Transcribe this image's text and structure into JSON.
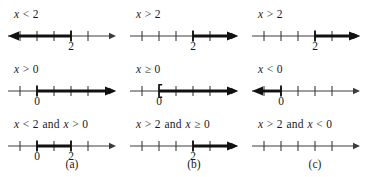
{
  "figure": {
    "background": "#ffffff",
    "ink": "#1a1a1a",
    "thin_color": "#3c3c3c",
    "thick_color": "#111111",
    "panels": [
      {
        "letter": "(a)",
        "x": 72
      },
      {
        "letter": "(b)",
        "x": 194
      },
      {
        "letter": "(c)",
        "x": 315
      }
    ],
    "cells": [
      {
        "id": "r1c1",
        "row": 0,
        "col": 0,
        "label": {
          "lhs_var": "x",
          "op": "<",
          "rhs": "2"
        },
        "label_text": "x < 2",
        "axis": {
          "ticks": [
            20,
            37,
            54,
            71,
            88
          ],
          "tick_numbers": [
            {
              "value": "2",
              "x": 71
            }
          ],
          "line_start": 8,
          "line_end": 116
        },
        "highlight": {
          "type": "ray-left",
          "from": 71,
          "to": 10,
          "endpoint": "open",
          "arrow": "left"
        }
      },
      {
        "id": "r1c2",
        "row": 0,
        "col": 1,
        "label": {
          "lhs_var": "x",
          "op": ">",
          "rhs": "2"
        },
        "label_text": "x > 2",
        "axis": {
          "ticks": [
            20,
            37,
            54,
            71,
            88
          ],
          "tick_numbers": [
            {
              "value": "2",
              "x": 71
            }
          ],
          "line_start": 8,
          "line_end": 116
        },
        "highlight": {
          "type": "ray-right",
          "from": 71,
          "to": 114,
          "endpoint": "open",
          "arrow": "right"
        }
      },
      {
        "id": "r1c3",
        "row": 0,
        "col": 2,
        "label": {
          "lhs_var": "x",
          "op": ">",
          "rhs": "2"
        },
        "label_text": "x > 2",
        "axis": {
          "ticks": [
            20,
            37,
            54,
            71,
            88
          ],
          "tick_numbers": [
            {
              "value": "2",
              "x": 71
            }
          ],
          "line_start": 8,
          "line_end": 116
        },
        "highlight": {
          "type": "ray-right",
          "from": 71,
          "to": 114,
          "endpoint": "open",
          "arrow": "right"
        }
      },
      {
        "id": "r2c1",
        "row": 1,
        "col": 0,
        "label": {
          "lhs_var": "x",
          "op": ">",
          "rhs": "0"
        },
        "label_text": "x > 0",
        "axis": {
          "ticks": [
            20,
            37,
            54,
            71,
            88
          ],
          "tick_numbers": [
            {
              "value": "0",
              "x": 37
            }
          ],
          "line_start": 8,
          "line_end": 116
        },
        "highlight": {
          "type": "ray-right",
          "from": 37,
          "to": 114,
          "endpoint": "open",
          "arrow": "right"
        }
      },
      {
        "id": "r2c2",
        "row": 1,
        "col": 1,
        "label": {
          "lhs_var": "x",
          "op": "≥",
          "rhs": "0"
        },
        "label_text": "x ≥ 0",
        "axis": {
          "ticks": [
            20,
            37,
            54,
            71,
            88
          ],
          "tick_numbers": [
            {
              "value": "0",
              "x": 37
            }
          ],
          "line_start": 8,
          "line_end": 116
        },
        "highlight": {
          "type": "ray-right",
          "from": 37,
          "to": 114,
          "endpoint": "closed-bracket",
          "arrow": "right"
        }
      },
      {
        "id": "r2c3",
        "row": 1,
        "col": 2,
        "label": {
          "lhs_var": "x",
          "op": "<",
          "rhs": "0"
        },
        "label_text": "x < 0",
        "axis": {
          "ticks": [
            20,
            37,
            54,
            71,
            88
          ],
          "tick_numbers": [
            {
              "value": "0",
              "x": 37
            }
          ],
          "line_start": 8,
          "line_end": 116
        },
        "highlight": {
          "type": "ray-left",
          "from": 37,
          "to": 10,
          "endpoint": "open",
          "arrow": "left"
        }
      },
      {
        "id": "r3c1",
        "row": 2,
        "col": 0,
        "label": {
          "lhs_var": "x",
          "op": "<",
          "rhs": "2",
          "conj": "and",
          "lhs_var2": "x",
          "op2": ">",
          "rhs2": "0"
        },
        "label_text": "x < 2 and x > 0",
        "axis": {
          "ticks": [
            20,
            37,
            54,
            71,
            88
          ],
          "tick_numbers": [
            {
              "value": "0",
              "x": 37
            },
            {
              "value": "2",
              "x": 71
            }
          ],
          "line_start": 8,
          "line_end": 116
        },
        "highlight": {
          "type": "segment",
          "from": 37,
          "to": 71,
          "endpoint": "open",
          "arrow": "none"
        }
      },
      {
        "id": "r3c2",
        "row": 2,
        "col": 1,
        "label": {
          "lhs_var": "x",
          "op": ">",
          "rhs": "2",
          "conj": "and",
          "lhs_var2": "x",
          "op2": "≥",
          "rhs2": "0"
        },
        "label_text": "x > 2 and x ≥ 0",
        "axis": {
          "ticks": [
            20,
            37,
            54,
            71,
            88
          ],
          "tick_numbers": [
            {
              "value": "2",
              "x": 71
            }
          ],
          "line_start": 8,
          "line_end": 116
        },
        "highlight": {
          "type": "ray-right",
          "from": 71,
          "to": 114,
          "endpoint": "open",
          "arrow": "right"
        }
      },
      {
        "id": "r3c3",
        "row": 2,
        "col": 2,
        "label": {
          "lhs_var": "x",
          "op": ">",
          "rhs": "2",
          "conj": "and",
          "lhs_var2": "x",
          "op2": "<",
          "rhs2": "0"
        },
        "label_text": "x > 2 and x < 0",
        "axis": {
          "ticks": [
            20,
            37,
            54,
            71,
            88
          ],
          "tick_numbers": [],
          "line_start": 8,
          "line_end": 116
        },
        "highlight": {
          "type": "none",
          "from": 0,
          "to": 0,
          "endpoint": "none",
          "arrow": "none"
        }
      }
    ]
  }
}
